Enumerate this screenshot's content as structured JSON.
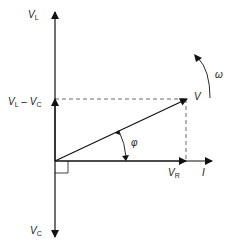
{
  "labels": {
    "vl": {
      "main": "V",
      "sub": "L"
    },
    "vlvc": {
      "main1": "V",
      "sub1": "L",
      "minus": " – ",
      "main2": "V",
      "sub2": "C"
    },
    "vc": {
      "main": "V",
      "sub": "C"
    },
    "v": "V",
    "vr": {
      "main": "V",
      "sub": "R"
    },
    "i": "I",
    "phi": "φ",
    "omega": "ω"
  },
  "colors": {
    "line": "#111111",
    "dash": "#444444"
  }
}
